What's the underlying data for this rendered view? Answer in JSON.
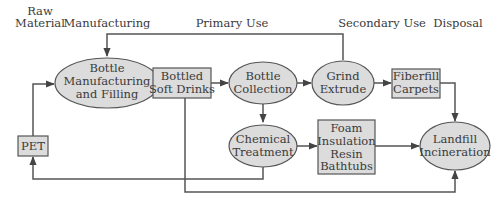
{
  "headers": {
    "raw_material_line1": "Raw",
    "raw_material_line2": "Material",
    "manufacturing": "Manufacturing",
    "primary_use": "Primary Use",
    "secondary_use": "Secondary Use",
    "disposal": "Disposal"
  },
  "nodes": {
    "bottle_mfg": {
      "shape": "ellipse",
      "lines": [
        "Bottle",
        "Manufacturing",
        "and Filling"
      ]
    },
    "soft_drinks": {
      "shape": "rect",
      "lines": [
        "Bottled",
        "Soft Drinks"
      ]
    },
    "bottle_collection": {
      "shape": "ellipse",
      "lines": [
        "Bottle",
        "Collection"
      ]
    },
    "grind_extrude": {
      "shape": "ellipse",
      "lines": [
        "Grind",
        "Extrude"
      ]
    },
    "fiberfill": {
      "shape": "rect",
      "lines": [
        "Fiberfill",
        "Carpets"
      ]
    },
    "pet": {
      "shape": "rect",
      "lines": [
        "PET"
      ]
    },
    "chemical_treatment": {
      "shape": "ellipse",
      "lines": [
        "Chemical",
        "Treatment"
      ]
    },
    "foam": {
      "shape": "rect",
      "lines": [
        "Foam",
        "Insulation",
        "Resin",
        "Bathtubs"
      ]
    },
    "landfill": {
      "shape": "ellipse",
      "lines": [
        "Landfill",
        "Incineration"
      ]
    }
  },
  "edges": [
    {
      "from": "pet",
      "to": "bottle_mfg"
    },
    {
      "from": "bottle_mfg",
      "to": "soft_drinks"
    },
    {
      "from": "soft_drinks",
      "to": "bottle_collection"
    },
    {
      "from": "bottle_collection",
      "to": "grind_extrude"
    },
    {
      "from": "grind_extrude",
      "to": "fiberfill"
    },
    {
      "from": "grind_extrude",
      "to": "bottle_mfg"
    },
    {
      "from": "bottle_collection",
      "to": "chemical_treatment"
    },
    {
      "from": "chemical_treatment",
      "to": "foam"
    },
    {
      "from": "chemical_treatment",
      "to": "pet"
    },
    {
      "from": "foam",
      "to": "landfill"
    },
    {
      "from": "fiberfill",
      "to": "landfill"
    },
    {
      "from": "soft_drinks",
      "to": "landfill"
    }
  ],
  "colors": {
    "node_fill": "#dcdcdc",
    "stroke": "#555555",
    "text": "#3a3a3a"
  }
}
